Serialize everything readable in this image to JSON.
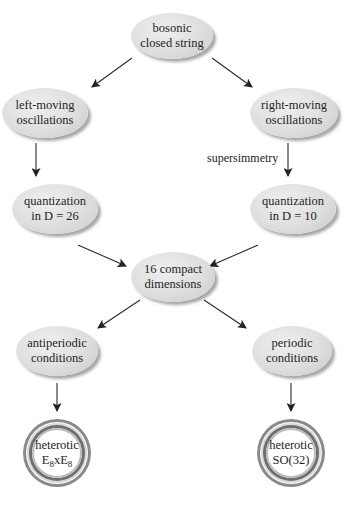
{
  "diagram": {
    "nodes": {
      "bosonic": {
        "line1": "bosonic",
        "line2": "closed string"
      },
      "left_moving": {
        "line1": "left-moving",
        "line2": "oscillations"
      },
      "right_moving": {
        "line1": "right-moving",
        "line2": "oscillations"
      },
      "quant_26": {
        "line1": "quantization",
        "line2": "in D = 26"
      },
      "quant_10": {
        "line1": "quantization",
        "line2": "in D = 10"
      },
      "compact": {
        "line1": "16 compact",
        "line2": "dimensions"
      },
      "antiperiodic": {
        "line1": "antiperiodic",
        "line2": "conditions"
      },
      "periodic": {
        "line1": "periodic",
        "line2": "conditions"
      },
      "het_e8": {
        "line1": "heterotic",
        "e": "E",
        "sub": "8",
        "x": "x"
      },
      "het_so32": {
        "line1": "heterotic",
        "line2": "SO(32)"
      }
    },
    "edge_labels": {
      "supersymmetry": "supersimmetry"
    },
    "edges": [
      {
        "from": "bosonic",
        "to": "left_moving"
      },
      {
        "from": "bosonic",
        "to": "right_moving"
      },
      {
        "from": "left_moving",
        "to": "quant_26"
      },
      {
        "from": "right_moving",
        "to": "quant_10",
        "label": "supersimmetry"
      },
      {
        "from": "quant_26",
        "to": "compact"
      },
      {
        "from": "quant_10",
        "to": "compact"
      },
      {
        "from": "compact",
        "to": "antiperiodic"
      },
      {
        "from": "compact",
        "to": "periodic"
      },
      {
        "from": "antiperiodic",
        "to": "het_e8"
      },
      {
        "from": "periodic",
        "to": "het_so32"
      }
    ],
    "colors": {
      "node_fill": "#dedede",
      "arrow": "#222222",
      "ring_dark": "#6f6f6f"
    }
  }
}
